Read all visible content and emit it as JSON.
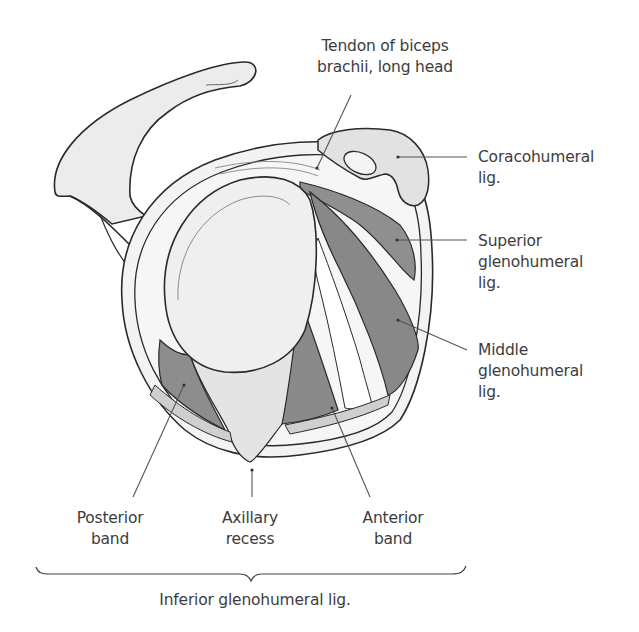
{
  "figure": {
    "colors": {
      "background": "#ffffff",
      "outline": "#2a2a2a",
      "bone_fill": "#ececec",
      "glenoid_fill": "#f1f1f1",
      "ligament_dark": "#8c8c8c",
      "ligament_light": "#c9c9c9",
      "leader_line": "#555555",
      "text": "#3d3d3d"
    }
  },
  "labels": {
    "tendon_biceps": {
      "line1": "Tendon of biceps",
      "line2": "brachii, long head"
    },
    "coracohumeral": {
      "line1": "Coracohumeral",
      "line2": "lig."
    },
    "superior_gh": {
      "line1": "Superior",
      "line2": "glenohumeral",
      "line3": "lig."
    },
    "middle_gh": {
      "line1": "Middle",
      "line2": "glenohumeral",
      "line3": "lig."
    },
    "posterior_band": {
      "line1": "Posterior",
      "line2": "band"
    },
    "axillary_recess": {
      "line1": "Axillary",
      "line2": "recess"
    },
    "anterior_band": {
      "line1": "Anterior",
      "line2": "band"
    },
    "inferior_gh": {
      "text": "Inferior glenohumeral lig."
    }
  }
}
